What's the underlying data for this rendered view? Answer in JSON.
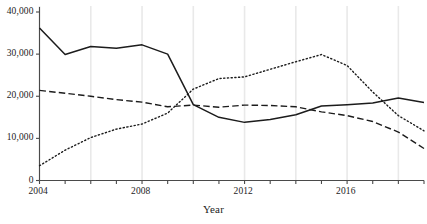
{
  "chart_data": {
    "type": "line",
    "title": "",
    "xlabel": "Year",
    "ylabel": "",
    "xlim": [
      2004,
      2019
    ],
    "ylim": [
      0,
      40000
    ],
    "grid": true,
    "legend": "none",
    "x": [
      2004,
      2005,
      2006,
      2007,
      2008,
      2009,
      2010,
      2011,
      2012,
      2013,
      2014,
      2015,
      2016,
      2017,
      2018,
      2019
    ],
    "x_ticks": [
      2004,
      2005,
      2006,
      2007,
      2008,
      2009,
      2010,
      2011,
      2012,
      2013,
      2014,
      2015,
      2016,
      2017,
      2018,
      2019
    ],
    "x_tick_labels": [
      "2004",
      "2008",
      "2012",
      "2016"
    ],
    "x_labeled_ticks": [
      2004,
      2008,
      2012,
      2016
    ],
    "y_ticks": [
      0,
      10000,
      20000,
      30000,
      40000
    ],
    "y_tick_labels": [
      "0",
      "10,000",
      "20,000",
      "30,000",
      "40,000"
    ],
    "series": [
      {
        "name": "solid-series",
        "style": "solid",
        "color": "#1c1c1c",
        "values": [
          36200,
          29900,
          31800,
          31400,
          32200,
          30000,
          18000,
          15000,
          13800,
          14500,
          15600,
          17700,
          18000,
          18400,
          19600,
          18500
        ]
      },
      {
        "name": "dashed-series",
        "style": "dashed",
        "color": "#1c1c1c",
        "values": [
          21400,
          20700,
          20000,
          19200,
          18600,
          17500,
          17900,
          17400,
          17900,
          17800,
          17500,
          16300,
          15400,
          14000,
          11500,
          7600
        ]
      },
      {
        "name": "dotted-series",
        "style": "dotted",
        "color": "#1c1c1c",
        "values": [
          3500,
          7200,
          10200,
          12200,
          13400,
          16000,
          21700,
          24200,
          24600,
          26400,
          28200,
          29900,
          27300,
          21000,
          15400,
          11800
        ]
      }
    ]
  },
  "axis": {
    "x_title": "Year"
  }
}
